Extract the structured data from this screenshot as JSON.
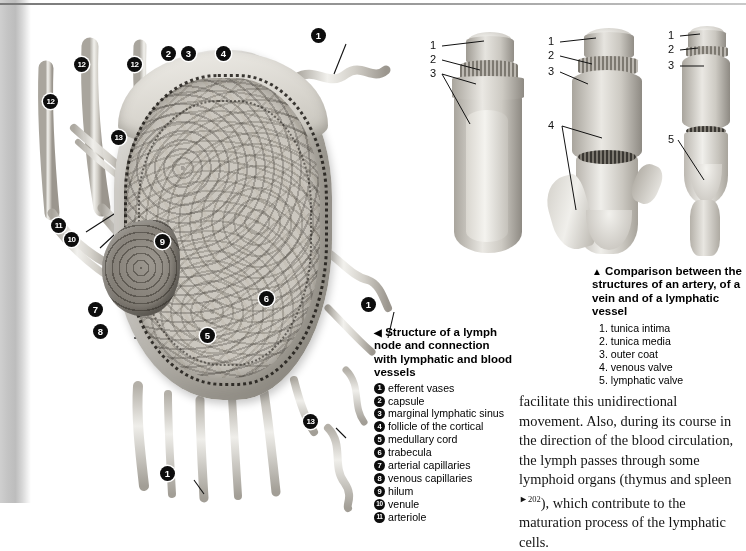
{
  "page": {
    "left_figure": {
      "name": "lymph-node-diagram",
      "callouts": [
        {
          "n": "1",
          "x": 311,
          "y": 28
        },
        {
          "n": "2",
          "x": 161,
          "y": 46
        },
        {
          "n": "3",
          "x": 181,
          "y": 46
        },
        {
          "n": "4",
          "x": 216,
          "y": 46
        },
        {
          "n": "12",
          "x": 74,
          "y": 57
        },
        {
          "n": "12",
          "x": 127,
          "y": 57
        },
        {
          "n": "12",
          "x": 43,
          "y": 94
        },
        {
          "n": "13",
          "x": 111,
          "y": 130
        },
        {
          "n": "11",
          "x": 51,
          "y": 218
        },
        {
          "n": "10",
          "x": 64,
          "y": 232
        },
        {
          "n": "9",
          "x": 155,
          "y": 234
        },
        {
          "n": "7",
          "x": 88,
          "y": 302
        },
        {
          "n": "6",
          "x": 259,
          "y": 291
        },
        {
          "n": "1",
          "x": 361,
          "y": 297
        },
        {
          "n": "8",
          "x": 93,
          "y": 324
        },
        {
          "n": "5",
          "x": 200,
          "y": 328
        },
        {
          "n": "13",
          "x": 303,
          "y": 414
        },
        {
          "n": "1",
          "x": 160,
          "y": 466
        }
      ]
    },
    "vessel_figures": {
      "name": "artery-vein-lymphatic-comparison",
      "artery": {
        "labels": [
          "1",
          "2",
          "3"
        ]
      },
      "vein": {
        "labels": [
          "1",
          "2",
          "3",
          "4"
        ]
      },
      "lymphatic": {
        "labels": [
          "1",
          "2",
          "3",
          "5"
        ]
      }
    },
    "caption_left": {
      "marker": "◀",
      "title": "Structure of a lymph node and connection with lymphatic and blood vessels",
      "items": [
        {
          "n": "1",
          "label": "efferent vases"
        },
        {
          "n": "2",
          "label": "capsule"
        },
        {
          "n": "3",
          "label": "marginal lymphatic sinus"
        },
        {
          "n": "4",
          "label": "follicle of the cortical"
        },
        {
          "n": "5",
          "label": "medullary cord"
        },
        {
          "n": "6",
          "label": "trabecula"
        },
        {
          "n": "7",
          "label": "arterial capillaries"
        },
        {
          "n": "8",
          "label": "venous capillaries"
        },
        {
          "n": "9",
          "label": "hilum"
        },
        {
          "n": "10",
          "label": "venule"
        },
        {
          "n": "11",
          "label": "arteriole"
        }
      ]
    },
    "caption_right": {
      "marker": "▲",
      "title": "Comparison between the structures of an artery, of a vein and of a lymphatic vessel",
      "items": [
        {
          "n": "1.",
          "label": "tunica intima"
        },
        {
          "n": "2.",
          "label": "tunica media"
        },
        {
          "n": "3.",
          "label": "outer coat"
        },
        {
          "n": "4.",
          "label": "venous valve"
        },
        {
          "n": "5.",
          "label": "lymphatic valve"
        }
      ]
    },
    "body": {
      "part1": "facilitate this unidirectional movement. Also, during its course in the direction of the blood circulation, the lymph passes through some lymphoid organs (thymus and spleen ",
      "xref_marker": "►",
      "xref_page": "202",
      "part2": "), which contribute to the maturation process of the lymphatic cells."
    }
  }
}
